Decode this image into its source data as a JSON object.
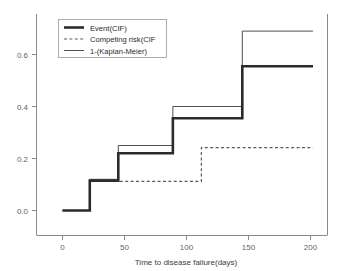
{
  "chart_data": {
    "type": "line",
    "subtype": "step-function-cumulative-incidence",
    "title": "",
    "xlabel": "Time to disease failure(days)",
    "ylabel": "",
    "xlim": [
      -12,
      214
    ],
    "ylim": [
      -0.035,
      0.745
    ],
    "xticks": [
      0,
      50,
      100,
      150,
      200
    ],
    "xticklabels": [
      "0",
      "50",
      "100",
      "150",
      "200"
    ],
    "yticks": [
      0.0,
      0.2,
      0.4,
      0.6
    ],
    "yticklabels": [
      "0.0",
      "0.2",
      "0.4",
      "0.6"
    ],
    "grid": false,
    "legend_position": "upper-left",
    "series": [
      {
        "name": "Event(CIF)",
        "style": "solid-thick",
        "color": "#2b2b2b",
        "x": [
          0,
          22,
          22,
          45,
          45,
          89,
          89,
          145,
          145,
          202
        ],
        "y": [
          0.0,
          0.0,
          0.115,
          0.115,
          0.22,
          0.22,
          0.355,
          0.355,
          0.555,
          0.555
        ],
        "steps": [
          {
            "time": 0,
            "value": 0.0
          },
          {
            "time": 22,
            "value": 0.115
          },
          {
            "time": 45,
            "value": 0.22
          },
          {
            "time": 89,
            "value": 0.355
          },
          {
            "time": 145,
            "value": 0.555
          },
          {
            "time": 202,
            "value": 0.555
          }
        ]
      },
      {
        "name": "Competing risk(CIF",
        "style": "dashed",
        "color": "#5a5a5a",
        "x": [
          0,
          22,
          22,
          112,
          112,
          202
        ],
        "y": [
          0.0,
          0.0,
          0.112,
          0.112,
          0.242,
          0.242
        ],
        "steps": [
          {
            "time": 0,
            "value": 0.0
          },
          {
            "time": 22,
            "value": 0.112
          },
          {
            "time": 112,
            "value": 0.242
          },
          {
            "time": 202,
            "value": 0.242
          }
        ]
      },
      {
        "name": "1-(Kaplan-Meier)",
        "style": "solid-thin",
        "color": "#3a3a3a",
        "x": [
          0,
          22,
          22,
          45,
          45,
          89,
          89,
          145,
          145,
          202
        ],
        "y": [
          0.0,
          0.0,
          0.12,
          0.12,
          0.25,
          0.25,
          0.4,
          0.4,
          0.69,
          0.69
        ],
        "steps": [
          {
            "time": 0,
            "value": 0.0
          },
          {
            "time": 22,
            "value": 0.12
          },
          {
            "time": 45,
            "value": 0.25
          },
          {
            "time": 89,
            "value": 0.4
          },
          {
            "time": 145,
            "value": 0.69
          },
          {
            "time": 202,
            "value": 0.69
          }
        ]
      }
    ],
    "legend_entries": [
      {
        "label": "Event(CIF)",
        "marker": "solid-thick"
      },
      {
        "label": "Competing risk(CIF",
        "marker": "dashed"
      },
      {
        "label": "1-(Kaplan-Meier)",
        "marker": "solid-thin"
      }
    ]
  },
  "colors": {
    "axis": "#8a8a8a",
    "tick_text": "#5f5f5f",
    "event": "#2b2b2b",
    "competing": "#5a5a5a",
    "km": "#3a3a3a",
    "background": "#ffffff"
  }
}
